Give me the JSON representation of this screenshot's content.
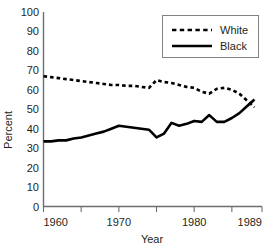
{
  "chart_data": {
    "type": "line",
    "title": "",
    "xlabel": "Year",
    "ylabel": "Percent",
    "xlim": [
      1960,
      1989
    ],
    "ylim": [
      0,
      100
    ],
    "grid": false,
    "legend_position": "top-right",
    "x_ticks_labeled": [
      "1960",
      "1970",
      "1980",
      "1989"
    ],
    "x_ticks_labeled_values": [
      1960,
      1970,
      1980,
      1989
    ],
    "x_minor_ticks": [
      1960,
      1965,
      1970,
      1975,
      1980,
      1985,
      1989
    ],
    "y_ticks": [
      "0",
      "10",
      "20",
      "30",
      "40",
      "50",
      "60",
      "70",
      "80",
      "90",
      "100"
    ],
    "y_tick_values": [
      0,
      10,
      20,
      30,
      40,
      50,
      60,
      70,
      80,
      90,
      100
    ],
    "x": [
      1960,
      1961,
      1962,
      1963,
      1964,
      1965,
      1966,
      1967,
      1968,
      1969,
      1970,
      1971,
      1972,
      1973,
      1974,
      1975,
      1976,
      1977,
      1978,
      1979,
      1980,
      1981,
      1982,
      1983,
      1984,
      1985,
      1986,
      1987,
      1988
    ],
    "series": [
      {
        "name": "White",
        "style": "dashed",
        "color": "#000000",
        "values": [
          67,
          66.5,
          66,
          65.5,
          65,
          64.5,
          64,
          63.5,
          63,
          62.5,
          62.5,
          62,
          62,
          61.5,
          61,
          65,
          64,
          63.5,
          62.5,
          61.5,
          61,
          59,
          58,
          60.5,
          61,
          60,
          58,
          54.5,
          51
        ]
      },
      {
        "name": "Black",
        "style": "solid",
        "color": "#000000",
        "values": [
          33.5,
          33.5,
          34,
          34,
          35,
          35.5,
          36.5,
          37.5,
          38.5,
          40,
          41.5,
          41,
          40.5,
          40,
          39.5,
          35.5,
          37.5,
          43,
          41.5,
          42.5,
          44,
          43.5,
          47,
          43.5,
          43.5,
          45.5,
          48,
          51.5,
          55
        ]
      }
    ]
  },
  "legend": {
    "items": [
      {
        "label": "White",
        "style": "dashed"
      },
      {
        "label": "Black",
        "style": "solid"
      }
    ]
  }
}
